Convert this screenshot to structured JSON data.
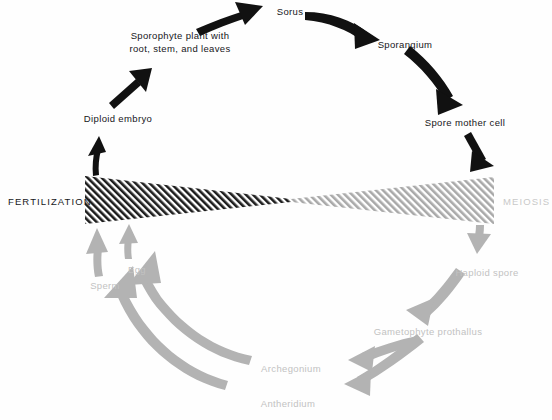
{
  "diagram": {
    "type": "cycle-diagram",
    "background_color": "#fefefe"
  },
  "phases": {
    "fertilization": {
      "label": "FERTILIZATION",
      "color": "#18181c",
      "side": "left"
    },
    "meiosis": {
      "label": "MEIOSIS",
      "color": "#c9c9c9",
      "side": "right"
    }
  },
  "band": {
    "name": "hourglass-band",
    "left_color": "#1d1d1d",
    "right_color": "#a9a9a9",
    "hatch": "diagonal"
  },
  "sporophyte": {
    "color": "#111111",
    "stages": [
      {
        "id": "diploid-embryo",
        "label": "Diploid embryo"
      },
      {
        "id": "sporophyte-plant",
        "label_line1": "Sporophyte plant with",
        "label_line2": "root, stem, and leaves"
      },
      {
        "id": "sorus",
        "label": "Sorus"
      },
      {
        "id": "sporangium",
        "label": "Sporangium"
      },
      {
        "id": "spore-mother-cell",
        "label": "Spore mother cell"
      }
    ]
  },
  "gametophyte": {
    "color": "#b3b3b3",
    "text_color": "#c2c2c2",
    "stages": [
      {
        "id": "haploid-spore",
        "label": "Haploid spore"
      },
      {
        "id": "gametophyte-prothallus",
        "label": "Gametophyte prothallus"
      },
      {
        "id": "archegonium",
        "label": "Archegonium"
      },
      {
        "id": "antheridium",
        "label": "Antheridium"
      },
      {
        "id": "egg",
        "label": "Egg"
      },
      {
        "id": "sperm",
        "label": "Sperm"
      }
    ]
  }
}
